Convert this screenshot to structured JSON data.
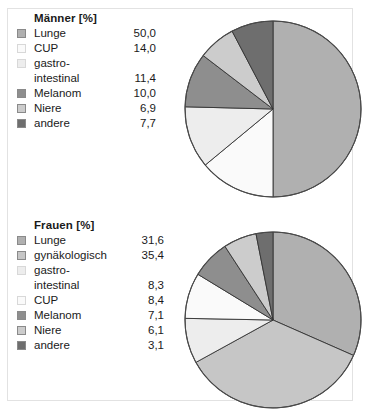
{
  "figure": {
    "background": "#ffffff",
    "border_color": "#e2e2e2"
  },
  "chart_data": [
    {
      "type": "pie",
      "id": "maenner",
      "title": "Männer [%]",
      "unit": "%",
      "legend_position": "left",
      "start_angle_deg": 0,
      "direction": "clockwise",
      "categories": [
        "Lunge",
        "CUP",
        "gastro-intestinal",
        "Melanom",
        "Niere",
        "andere"
      ],
      "values": [
        50.0,
        14.0,
        11.4,
        10.0,
        6.9,
        7.7
      ],
      "value_labels": [
        "50,0",
        "14,0",
        "11,4",
        "10,0",
        "6,9",
        "7,7"
      ],
      "colors": [
        "#b0b0b0",
        "#fafafa",
        "#ededed",
        "#8e8e8e",
        "#cccccc",
        "#6e6e6e"
      ],
      "slice_edge_color": "#333333",
      "slices": [
        {
          "label": "Lunge",
          "value": 50.0,
          "label_lines": [
            "Lunge"
          ],
          "color": "#b0b0b0"
        },
        {
          "label": "CUP",
          "value": 14.0,
          "label_lines": [
            "CUP"
          ],
          "color": "#fafafa"
        },
        {
          "label": "gastro-intestinal",
          "value": 11.4,
          "label_lines": [
            "gastro-",
            "intestinal"
          ],
          "color": "#ededed"
        },
        {
          "label": "Melanom",
          "value": 10.0,
          "label_lines": [
            "Melanom"
          ],
          "color": "#8e8e8e"
        },
        {
          "label": "Niere",
          "value": 6.9,
          "label_lines": [
            "Niere"
          ],
          "color": "#cccccc"
        },
        {
          "label": "andere",
          "value": 7.7,
          "label_lines": [
            "andere"
          ],
          "color": "#6e6e6e"
        }
      ]
    },
    {
      "type": "pie",
      "id": "frauen",
      "title": "Frauen [%]",
      "unit": "%",
      "legend_position": "left",
      "start_angle_deg": 0,
      "direction": "clockwise",
      "categories": [
        "Lunge",
        "gynäkologisch",
        "gastro-intestinal",
        "CUP",
        "Melanom",
        "Niere",
        "andere"
      ],
      "values": [
        31.6,
        35.4,
        8.3,
        8.4,
        7.1,
        6.1,
        3.1
      ],
      "value_labels": [
        "31,6",
        "35,4",
        "8,3",
        "8,4",
        "7,1",
        "6,1",
        "3,1"
      ],
      "colors": [
        "#b0b0b0",
        "#c6c6c6",
        "#ededed",
        "#fafafa",
        "#8e8e8e",
        "#cccccc",
        "#6e6e6e"
      ],
      "slice_edge_color": "#333333",
      "slices": [
        {
          "label": "Lunge",
          "value": 31.6,
          "label_lines": [
            "Lunge"
          ],
          "color": "#b0b0b0"
        },
        {
          "label": "gynäkologisch",
          "value": 35.4,
          "label_lines": [
            "gynäkologisch"
          ],
          "color": "#c6c6c6"
        },
        {
          "label": "gastro-intestinal",
          "value": 8.3,
          "label_lines": [
            "gastro-",
            "intestinal"
          ],
          "color": "#ededed"
        },
        {
          "label": "CUP",
          "value": 8.4,
          "label_lines": [
            "CUP"
          ],
          "color": "#fafafa"
        },
        {
          "label": "Melanom",
          "value": 7.1,
          "label_lines": [
            "Melanom"
          ],
          "color": "#8e8e8e"
        },
        {
          "label": "Niere",
          "value": 6.1,
          "label_lines": [
            "Niere"
          ],
          "color": "#cccccc"
        },
        {
          "label": "andere",
          "value": 3.1,
          "label_lines": [
            "andere"
          ],
          "color": "#6e6e6e"
        }
      ]
    }
  ]
}
